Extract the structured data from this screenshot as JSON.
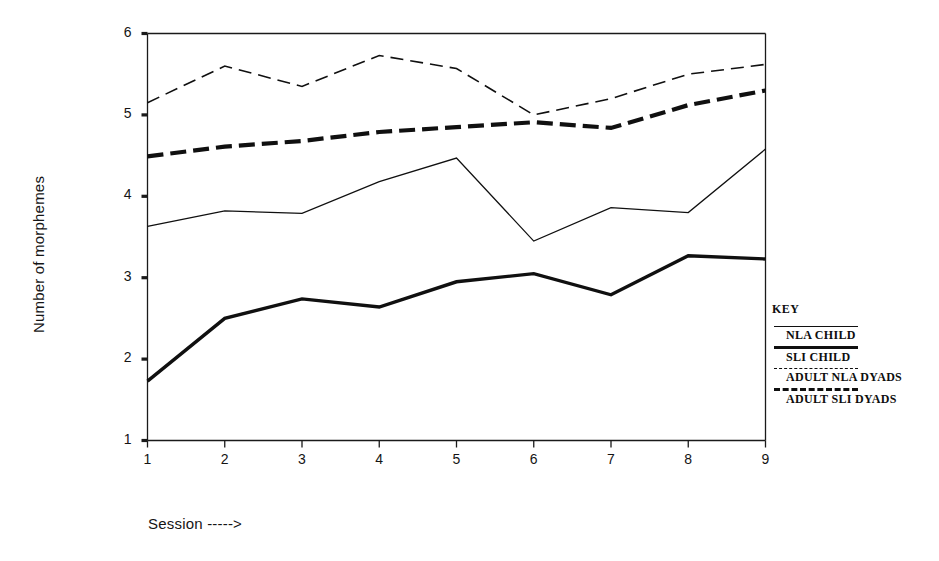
{
  "chart_data": {
    "type": "line",
    "title": "",
    "xlabel": "Session ----->",
    "ylabel": "Number of morphemes",
    "x": [
      1,
      2,
      3,
      4,
      5,
      6,
      7,
      8,
      9
    ],
    "xtick_labels": [
      "1",
      "2",
      "3",
      "4",
      "5",
      "6",
      "7",
      "8",
      "9"
    ],
    "ytick_labels": [
      "1",
      "2",
      "3",
      "4",
      "5",
      "6"
    ],
    "xlim": [
      1,
      9
    ],
    "ylim": [
      1,
      6
    ],
    "grid": false,
    "legend_position": "right-outside",
    "series": [
      {
        "name": "NLA CHILD",
        "style": "thin-solid",
        "values": [
          3.63,
          3.82,
          3.79,
          4.18,
          4.47,
          3.45,
          3.86,
          3.8,
          4.58
        ]
      },
      {
        "name": "SLI CHILD",
        "style": "thick-solid",
        "values": [
          1.73,
          2.5,
          2.74,
          2.64,
          2.95,
          3.05,
          2.79,
          3.27,
          3.23
        ]
      },
      {
        "name": "ADULT NLA DYADS",
        "style": "thin-dash",
        "values": [
          5.15,
          5.6,
          5.35,
          5.73,
          5.57,
          5.0,
          5.2,
          5.5,
          5.62
        ]
      },
      {
        "name": "ADULT SLI DYADS",
        "style": "thick-dash",
        "values": [
          4.49,
          4.61,
          4.68,
          4.79,
          4.85,
          4.91,
          4.84,
          5.12,
          5.3
        ]
      }
    ]
  },
  "legend": {
    "title": "KEY",
    "entries": [
      {
        "label": "NLA CHILD",
        "style": "thin-solid"
      },
      {
        "label": "SLI CHILD",
        "style": "thick-solid"
      },
      {
        "label": "ADULT NLA DYADS",
        "style": "thin-dash"
      },
      {
        "label": "ADULT SLI DYADS",
        "style": "thick-dash"
      }
    ]
  },
  "axes": {
    "y_title": "Number of morphemes",
    "x_title": "Session ----->"
  },
  "colors": {
    "ink": "#101010",
    "background": "#ffffff"
  }
}
